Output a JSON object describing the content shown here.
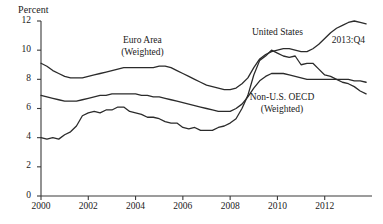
{
  "chart_data": {
    "type": "line",
    "title": "",
    "ylabel": "Percent",
    "xlabel": "",
    "ylim": [
      0,
      12
    ],
    "xlim": [
      2000,
      2014
    ],
    "grid": false,
    "legend_position": "inline-annotations",
    "y_ticks": [
      0,
      2,
      4,
      6,
      8,
      10,
      12
    ],
    "y_tick_labels": [
      "0",
      "2",
      "4",
      "6",
      "8",
      "10",
      "12"
    ],
    "x_ticks": [
      2000,
      2002,
      2004,
      2006,
      2008,
      2010,
      2012
    ],
    "x_tick_labels": [
      "2000",
      "2002",
      "2004",
      "2006",
      "2008",
      "2010",
      "2012"
    ],
    "annotations": [
      {
        "text": "2013:Q4",
        "x": 2013.0,
        "y": 10.6
      }
    ],
    "series": [
      {
        "name": "Euro Area (Weighted)",
        "label_lines": [
          "Euro Area",
          "(Weighted)"
        ],
        "label_x": 2004.3,
        "label_y": 10.6,
        "color": "#2b2b2b",
        "x": [
          2000.0,
          2000.25,
          2000.5,
          2000.75,
          2001.0,
          2001.25,
          2001.5,
          2001.75,
          2002.0,
          2002.25,
          2002.5,
          2002.75,
          2003.0,
          2003.25,
          2003.5,
          2003.75,
          2004.0,
          2004.25,
          2004.5,
          2004.75,
          2005.0,
          2005.25,
          2005.5,
          2005.75,
          2006.0,
          2006.25,
          2006.5,
          2006.75,
          2007.0,
          2007.25,
          2007.5,
          2007.75,
          2008.0,
          2008.25,
          2008.5,
          2008.75,
          2009.0,
          2009.25,
          2009.5,
          2009.75,
          2010.0,
          2010.25,
          2010.5,
          2010.75,
          2011.0,
          2011.25,
          2011.5,
          2011.75,
          2012.0,
          2012.25,
          2012.5,
          2012.75,
          2013.0,
          2013.25,
          2013.5,
          2013.75
        ],
        "y": [
          9.1,
          8.9,
          8.6,
          8.4,
          8.2,
          8.1,
          8.1,
          8.1,
          8.2,
          8.3,
          8.4,
          8.5,
          8.6,
          8.7,
          8.8,
          8.8,
          8.8,
          8.8,
          8.8,
          8.8,
          8.9,
          8.9,
          8.8,
          8.6,
          8.4,
          8.2,
          8.0,
          7.8,
          7.6,
          7.5,
          7.4,
          7.3,
          7.3,
          7.4,
          7.7,
          8.1,
          8.8,
          9.4,
          9.7,
          9.9,
          10.0,
          10.1,
          10.1,
          10.0,
          9.9,
          9.9,
          10.1,
          10.4,
          10.8,
          11.2,
          11.5,
          11.7,
          11.9,
          12.0,
          11.9,
          11.8
        ]
      },
      {
        "name": "Non-U.S. OECD (Weighted)",
        "label_lines": [
          "Non-U.S. OECD",
          "(Weighted)"
        ],
        "label_x": 2010.2,
        "label_y": 6.7,
        "color": "#2b2b2b",
        "x": [
          2000.0,
          2000.25,
          2000.5,
          2000.75,
          2001.0,
          2001.25,
          2001.5,
          2001.75,
          2002.0,
          2002.25,
          2002.5,
          2002.75,
          2003.0,
          2003.25,
          2003.5,
          2003.75,
          2004.0,
          2004.25,
          2004.5,
          2004.75,
          2005.0,
          2005.25,
          2005.5,
          2005.75,
          2006.0,
          2006.25,
          2006.5,
          2006.75,
          2007.0,
          2007.25,
          2007.5,
          2007.75,
          2008.0,
          2008.25,
          2008.5,
          2008.75,
          2009.0,
          2009.25,
          2009.5,
          2009.75,
          2010.0,
          2010.25,
          2010.5,
          2010.75,
          2011.0,
          2011.25,
          2011.5,
          2011.75,
          2012.0,
          2012.25,
          2012.5,
          2012.75,
          2013.0,
          2013.25,
          2013.5,
          2013.75
        ],
        "y": [
          6.9,
          6.8,
          6.7,
          6.6,
          6.5,
          6.5,
          6.5,
          6.6,
          6.7,
          6.8,
          6.9,
          6.9,
          7.0,
          7.0,
          7.0,
          7.0,
          7.0,
          6.9,
          6.9,
          6.8,
          6.8,
          6.7,
          6.6,
          6.5,
          6.4,
          6.3,
          6.2,
          6.1,
          6.0,
          5.9,
          5.8,
          5.8,
          5.8,
          6.0,
          6.3,
          6.8,
          7.4,
          7.9,
          8.2,
          8.4,
          8.4,
          8.4,
          8.3,
          8.2,
          8.1,
          8.0,
          8.0,
          8.0,
          8.0,
          8.0,
          8.0,
          8.0,
          8.0,
          7.9,
          7.9,
          7.8
        ]
      },
      {
        "name": "United States",
        "label_lines": [
          "United States"
        ],
        "label_x": 2010.0,
        "label_y": 11.2,
        "color": "#2b2b2b",
        "x": [
          2000.0,
          2000.25,
          2000.5,
          2000.75,
          2001.0,
          2001.25,
          2001.5,
          2001.75,
          2002.0,
          2002.25,
          2002.5,
          2002.75,
          2003.0,
          2003.25,
          2003.5,
          2003.75,
          2004.0,
          2004.25,
          2004.5,
          2004.75,
          2005.0,
          2005.25,
          2005.5,
          2005.75,
          2006.0,
          2006.25,
          2006.5,
          2006.75,
          2007.0,
          2007.25,
          2007.5,
          2007.75,
          2008.0,
          2008.25,
          2008.5,
          2008.75,
          2009.0,
          2009.25,
          2009.5,
          2009.75,
          2010.0,
          2010.25,
          2010.5,
          2010.75,
          2011.0,
          2011.25,
          2011.5,
          2011.75,
          2012.0,
          2012.25,
          2012.5,
          2012.75,
          2013.0,
          2013.25,
          2013.5,
          2013.75
        ],
        "y": [
          4.0,
          3.9,
          4.0,
          3.9,
          4.2,
          4.4,
          4.8,
          5.5,
          5.7,
          5.8,
          5.7,
          5.9,
          5.9,
          6.1,
          6.1,
          5.8,
          5.7,
          5.6,
          5.4,
          5.4,
          5.3,
          5.1,
          5.0,
          5.0,
          4.7,
          4.6,
          4.7,
          4.5,
          4.5,
          4.5,
          4.7,
          4.8,
          5.0,
          5.3,
          6.0,
          6.9,
          8.3,
          9.3,
          9.6,
          10.0,
          9.8,
          9.6,
          9.5,
          9.6,
          9.0,
          9.1,
          9.1,
          8.7,
          8.3,
          8.2,
          8.0,
          7.8,
          7.7,
          7.5,
          7.2,
          7.0
        ]
      }
    ]
  }
}
